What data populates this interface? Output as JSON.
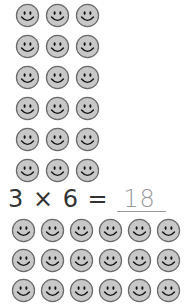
{
  "top_group": {
    "rows": 6,
    "cols": 3,
    "icon": "smiley-face-icon",
    "count": 18
  },
  "equation": {
    "left": "3 × 6 =",
    "answer": "18"
  },
  "bottom_group": {
    "rows": 3,
    "cols": 6,
    "icon": "smiley-face-icon",
    "count": 18
  },
  "colors": {
    "face_fill": "#c8c8c8",
    "face_stroke": "#6a6a6a",
    "features": "#111111",
    "answer_color": "#999999"
  }
}
